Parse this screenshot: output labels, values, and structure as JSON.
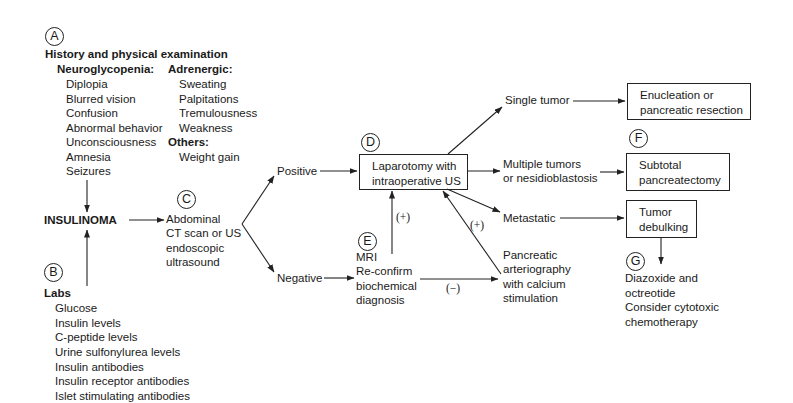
{
  "diagram": {
    "title_node": "INSULINOMA",
    "sections": {
      "A": {
        "marker": "A",
        "heading": "History and physical examination",
        "neuroglycopenia": {
          "label": "Neuroglycopenia:",
          "items": [
            "Diplopia",
            "Blurred vision",
            "Confusion",
            "Abnormal behavior",
            "Unconsciousness",
            "Amnesia",
            "Seizures"
          ]
        },
        "adrenergic": {
          "label": "Adrenergic:",
          "items": [
            "Sweating",
            "Palpitations",
            "Tremulousness",
            "Weakness"
          ]
        },
        "others": {
          "label": "Others:",
          "items": [
            "Weight gain"
          ]
        }
      },
      "B": {
        "marker": "B",
        "heading": "Labs",
        "items": [
          "Glucose",
          "Insulin levels",
          "C-peptide levels",
          "Urine sulfonylurea levels",
          "Insulin antibodies",
          "Insulin receptor antibodies",
          "Islet stimulating antibodies"
        ]
      },
      "C": {
        "marker": "C",
        "lines": [
          "Abdominal",
          "CT scan or US",
          "endoscopic",
          "ultrasound"
        ]
      },
      "D": {
        "marker": "D",
        "lines": [
          "Laparotomy with",
          "intraoperative US"
        ]
      },
      "E": {
        "marker": "E",
        "lines": [
          "MRI",
          "Re-confirm",
          "biochemical",
          "diagnosis"
        ]
      },
      "F": {
        "marker": "F",
        "lines": [
          "Subtotal",
          "pancreatectomy"
        ]
      },
      "G": {
        "marker": "G",
        "lines": [
          "Diazoxide and",
          "octreotide",
          "Consider cytotoxic",
          "chemotherapy"
        ]
      }
    },
    "branches": {
      "positive": "Positive",
      "negative": "Negative",
      "single_tumor": "Single tumor",
      "multiple": [
        "Multiple tumors",
        "or nesidioblastosis"
      ],
      "metastatic": "Metastatic",
      "arteriography": [
        "Pancreatic",
        "arteriography",
        "with calcium",
        "stimulation"
      ]
    },
    "outcomes": {
      "enucleation": [
        "Enucleation or",
        "pancreatic resection"
      ],
      "debulking": [
        "Tumor",
        "debulking"
      ]
    },
    "edge_labels": {
      "mri_positive": "(+)",
      "arteriography_positive": "(+)",
      "negative": "(−)"
    }
  }
}
